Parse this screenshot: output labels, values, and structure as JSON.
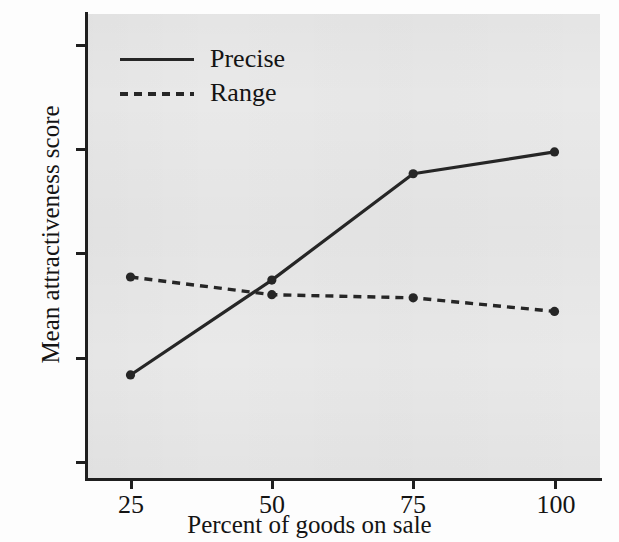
{
  "chart_data": {
    "type": "line",
    "title": "",
    "xlabel": "Percent of goods on sale",
    "ylabel": "Mean attractiveness score",
    "categories": [
      "25",
      "50",
      "75",
      "100"
    ],
    "x": [
      25,
      50,
      75,
      100
    ],
    "xlim": [
      18,
      110
    ],
    "ylim": [
      0.8,
      5.25
    ],
    "xticks": [
      "25",
      "50",
      "75",
      "100"
    ],
    "yticks": [
      "1",
      "2",
      "3",
      "4",
      "5"
    ],
    "grid": false,
    "legend_position": "upper-left-inside",
    "series": [
      {
        "name": "Precise",
        "style": "solid",
        "color": "#262626",
        "values": [
          1.83,
          2.74,
          3.76,
          3.97
        ]
      },
      {
        "name": "Range",
        "style": "dashed",
        "color": "#262626",
        "values": [
          2.77,
          2.6,
          2.57,
          2.44
        ]
      }
    ]
  },
  "legend": {
    "items": [
      {
        "label": "Precise",
        "swatch": "solid-line-icon"
      },
      {
        "label": "Range",
        "swatch": "dashed-line-icon"
      }
    ]
  },
  "colors": {
    "panel_background": "#e9e9e9",
    "figure_background": "#fdfdfd",
    "axis": "#1f1f1f",
    "series": "#262626",
    "text": "#141414"
  }
}
